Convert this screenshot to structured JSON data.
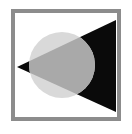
{
  "icon": {
    "label": "",
    "colors": {
      "background": "#ffffff",
      "frame": "#8c8c8c",
      "frame_inner": "#ffffff",
      "circle": "#d9d9d9",
      "overlap": "#a9a9a9",
      "triangle": "#0a0a0a"
    },
    "frame": {
      "x": 13,
      "y": 11,
      "width": 106,
      "height": 108,
      "stroke": 4
    },
    "circle": {
      "cx": 62,
      "cy": 65,
      "r": 33
    },
    "triangle": {
      "points": "17,67 116,20 116,112"
    }
  }
}
